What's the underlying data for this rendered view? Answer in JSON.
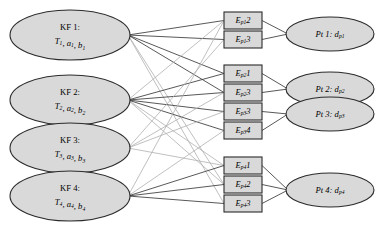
{
  "diagram": {
    "type": "tripartite-graph",
    "background_color": "#ffffff",
    "shape_fill": "#d9d9d9",
    "shape_stroke": "#2b2b2b",
    "edge_dark_color": "#3a3a3a",
    "edge_light_color": "#b0b0b0",
    "columns": {
      "left_label": "KF",
      "middle_label": "Ep",
      "right_label": "Pt"
    },
    "kf_nodes": [
      {
        "id": "kf1",
        "title": "KF 1:",
        "params": "T",
        "p_sub": "1",
        "params_rest": ", a",
        "a_sub": "1",
        "params_rest2": ", b",
        "b_sub": "1",
        "cx": 70,
        "cy": 35,
        "rx": 60,
        "ry": 25
      },
      {
        "id": "kf2",
        "title": "KF 2:",
        "params": "T",
        "p_sub": "2",
        "params_rest": ", a",
        "a_sub": "2",
        "params_rest2": ", b",
        "b_sub": "2",
        "cx": 70,
        "cy": 100,
        "rx": 60,
        "ry": 25
      },
      {
        "id": "kf3",
        "title": "KF 3:",
        "params": "T",
        "p_sub": "3",
        "params_rest": ", a",
        "a_sub": "3",
        "params_rest2": ", b",
        "b_sub": "3",
        "cx": 70,
        "cy": 148,
        "rx": 60,
        "ry": 25
      },
      {
        "id": "kf4",
        "title": "KF 4:",
        "params": "T",
        "p_sub": "4",
        "params_rest": ", a",
        "a_sub": "4",
        "params_rest2": ", b",
        "b_sub": "4",
        "cx": 70,
        "cy": 196,
        "rx": 60,
        "ry": 25
      }
    ],
    "ep_groups": [
      {
        "group_id": "group-p1",
        "boxes": [
          {
            "id": "ep1-2",
            "base": "E",
            "sub": "p1",
            "num": "2",
            "x": 224,
            "y": 12,
            "w": 38,
            "h": 17
          },
          {
            "id": "ep1-3",
            "base": "E",
            "sub": "p1",
            "num": "3",
            "x": 224,
            "y": 31,
            "w": 38,
            "h": 17
          }
        ]
      },
      {
        "group_id": "group-p2p3",
        "boxes": [
          {
            "id": "ep2-1",
            "base": "E",
            "sub": "p2",
            "num": "1",
            "x": 224,
            "y": 65,
            "w": 38,
            "h": 17
          },
          {
            "id": "ep2-3",
            "base": "E",
            "sub": "p2",
            "num": "3",
            "x": 224,
            "y": 84,
            "w": 38,
            "h": 17
          },
          {
            "id": "ep3-3",
            "base": "E",
            "sub": "p3",
            "num": "3",
            "x": 224,
            "y": 103,
            "w": 38,
            "h": 17
          },
          {
            "id": "ep3-4",
            "base": "E",
            "sub": "p3",
            "num": "4",
            "x": 224,
            "y": 122,
            "w": 38,
            "h": 17
          }
        ]
      },
      {
        "group_id": "group-p4",
        "boxes": [
          {
            "id": "ep4-1",
            "base": "E",
            "sub": "p4",
            "num": "1",
            "x": 224,
            "y": 157,
            "w": 38,
            "h": 17
          },
          {
            "id": "ep4-2",
            "base": "E",
            "sub": "p4",
            "num": "2",
            "x": 224,
            "y": 176,
            "w": 38,
            "h": 17
          },
          {
            "id": "ep4-3",
            "base": "E",
            "sub": "p4",
            "num": "3",
            "x": 224,
            "y": 195,
            "w": 38,
            "h": 17
          }
        ]
      }
    ],
    "pt_nodes": [
      {
        "id": "pt1",
        "prefix": "Pt 1: d",
        "sub": "p1",
        "cx": 330,
        "cy": 34,
        "rx": 44,
        "ry": 17
      },
      {
        "id": "pt2",
        "prefix": "Pt 2: d",
        "sub": "p2",
        "cx": 330,
        "cy": 89,
        "rx": 44,
        "ry": 17
      },
      {
        "id": "pt3",
        "prefix": "Pt 3: d",
        "sub": "p3",
        "cx": 330,
        "cy": 114,
        "rx": 44,
        "ry": 17
      },
      {
        "id": "pt4",
        "prefix": "Pt 4: d",
        "sub": "p4",
        "cx": 330,
        "cy": 190,
        "rx": 44,
        "ry": 17
      }
    ],
    "kf_to_ep_edges": [
      {
        "from": "kf1",
        "to": "ep1-2",
        "tone": "dark"
      },
      {
        "from": "kf1",
        "to": "ep1-3",
        "tone": "dark"
      },
      {
        "from": "kf1",
        "to": "ep2-1",
        "tone": "dark"
      },
      {
        "from": "kf1",
        "to": "ep2-3",
        "tone": "dark"
      },
      {
        "from": "kf1",
        "to": "ep4-2",
        "tone": "light"
      },
      {
        "from": "kf1",
        "to": "ep4-3",
        "tone": "light"
      },
      {
        "from": "kf2",
        "to": "ep1-2",
        "tone": "light"
      },
      {
        "from": "kf2",
        "to": "ep2-1",
        "tone": "dark"
      },
      {
        "from": "kf2",
        "to": "ep2-3",
        "tone": "dark"
      },
      {
        "from": "kf2",
        "to": "ep3-3",
        "tone": "dark"
      },
      {
        "from": "kf2",
        "to": "ep3-4",
        "tone": "dark"
      },
      {
        "from": "kf2",
        "to": "ep4-1",
        "tone": "light"
      },
      {
        "from": "kf2",
        "to": "ep4-2",
        "tone": "light"
      },
      {
        "from": "kf3",
        "to": "ep1-3",
        "tone": "light"
      },
      {
        "from": "kf3",
        "to": "ep2-3",
        "tone": "light"
      },
      {
        "from": "kf3",
        "to": "ep3-3",
        "tone": "light"
      },
      {
        "from": "kf3",
        "to": "ep4-1",
        "tone": "light"
      },
      {
        "from": "kf4",
        "to": "ep1-2",
        "tone": "light"
      },
      {
        "from": "kf4",
        "to": "ep3-4",
        "tone": "light"
      },
      {
        "from": "kf4",
        "to": "ep4-1",
        "tone": "dark"
      },
      {
        "from": "kf4",
        "to": "ep4-2",
        "tone": "dark"
      },
      {
        "from": "kf4",
        "to": "ep4-3",
        "tone": "dark"
      }
    ],
    "ep_to_pt_edges": [
      {
        "from": "ep1-2",
        "to": "pt1",
        "tone": "dark"
      },
      {
        "from": "ep1-3",
        "to": "pt1",
        "tone": "dark"
      },
      {
        "from": "ep2-1",
        "to": "pt2",
        "tone": "dark"
      },
      {
        "from": "ep2-3",
        "to": "pt2",
        "tone": "dark"
      },
      {
        "from": "ep3-3",
        "to": "pt3",
        "tone": "dark"
      },
      {
        "from": "ep3-4",
        "to": "pt3",
        "tone": "dark"
      },
      {
        "from": "ep4-1",
        "to": "pt4",
        "tone": "dark"
      },
      {
        "from": "ep4-2",
        "to": "pt4",
        "tone": "dark"
      },
      {
        "from": "ep4-3",
        "to": "pt4",
        "tone": "dark"
      }
    ]
  }
}
